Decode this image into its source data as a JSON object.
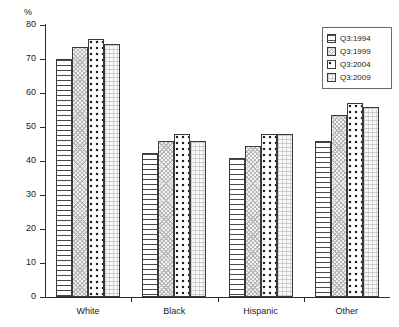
{
  "chart_data": {
    "type": "bar",
    "title": "",
    "subtitle": "",
    "xlabel": "",
    "ylabel": "%",
    "ylim": [
      0,
      80
    ],
    "yticks": [
      0,
      10,
      20,
      30,
      40,
      50,
      60,
      70,
      80
    ],
    "grid": false,
    "legend_position": "top-right",
    "categories": [
      "White",
      "Black",
      "Hispanic",
      "Other"
    ],
    "series": [
      {
        "name": "Q3:1994",
        "pattern": "horizontal-lines",
        "values": [
          70.0,
          42.5,
          41.0,
          46.0
        ]
      },
      {
        "name": "Q3:1999",
        "pattern": "fine-stipple",
        "values": [
          73.5,
          46.0,
          44.5,
          53.5
        ]
      },
      {
        "name": "Q3:2004",
        "pattern": "bold-dots",
        "values": [
          76.0,
          48.0,
          48.0,
          57.0
        ]
      },
      {
        "name": "Q3:2009",
        "pattern": "fine-grid",
        "values": [
          74.5,
          46.0,
          48.0,
          56.0
        ]
      }
    ]
  },
  "axis": {
    "y_unit_label": "%",
    "y_tick_labels": [
      "0",
      "10",
      "20",
      "30",
      "40",
      "50",
      "60",
      "70",
      "80"
    ],
    "x_tick_labels": [
      "White",
      "Black",
      "Hispanic",
      "Other"
    ]
  },
  "legend": {
    "items": [
      {
        "label": "Q3:1994",
        "pattern": "horizontal-lines"
      },
      {
        "label": "Q3:1999",
        "pattern": "fine-stipple"
      },
      {
        "label": "Q3:2004",
        "pattern": "bold-dots"
      },
      {
        "label": "Q3:2009",
        "pattern": "fine-grid"
      }
    ]
  },
  "colors": {
    "axis": "#2b2b2b",
    "bar_outline": "#3a3a3a",
    "text": "#1a1a1a",
    "background": "#ffffff"
  }
}
